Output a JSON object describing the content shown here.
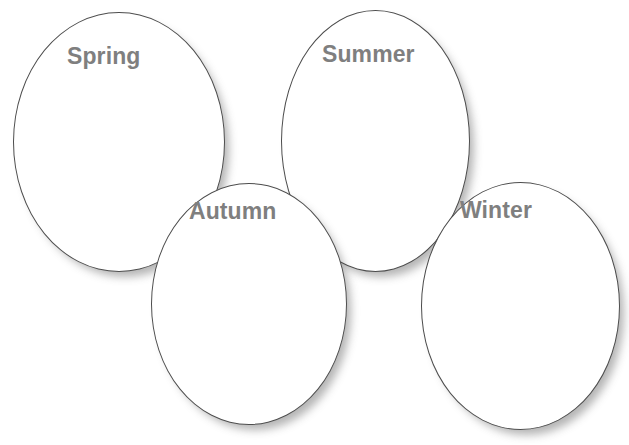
{
  "diagram": {
    "background_color": "#ffffff",
    "shape_fill_color": "#ffffff",
    "shape_outline_color": "#4d4d4d",
    "label_color": "#7f7f7f",
    "shadow_color": "rgba(70,70,70,0.40)",
    "shapes": [
      {
        "id": "spring",
        "label": "Spring",
        "shape": "ellipse",
        "x": 13,
        "y": 12,
        "width": 212,
        "height": 260,
        "label_x": 53,
        "label_y": 32,
        "z": 1
      },
      {
        "id": "summer",
        "label": "Summer",
        "shape": "ellipse",
        "x": 281,
        "y": 10,
        "width": 189,
        "height": 262,
        "label_x": 40,
        "label_y": 32,
        "z": 2
      },
      {
        "id": "autumn",
        "label": "Autumn",
        "shape": "ellipse",
        "x": 151,
        "y": 183,
        "width": 196,
        "height": 242,
        "label_x": 37,
        "label_y": 16,
        "z": 3
      },
      {
        "id": "winter",
        "label": "Winter",
        "shape": "ellipse",
        "x": 421,
        "y": 182,
        "width": 199,
        "height": 248,
        "label_x": 38,
        "label_y": 16,
        "z": 4
      }
    ]
  }
}
